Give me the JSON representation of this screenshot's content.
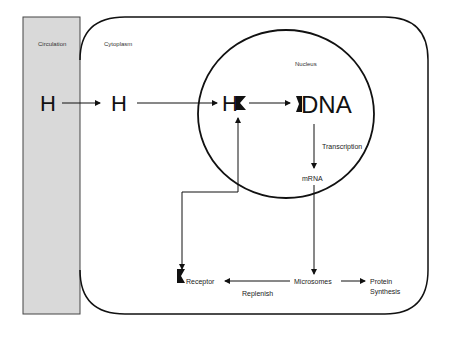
{
  "diagram": {
    "regions": {
      "circulation": "Circulation",
      "cytoplasm": "Cytoplasm",
      "nucleus": "Nucleus"
    },
    "nodes": {
      "h_circulation": "H",
      "h_cytoplasm": "H",
      "h_nucleus": "H",
      "dna": "DNA",
      "mrna": "mRNA",
      "receptor": "Receptor",
      "microsomes": "Microsomes",
      "protein_synthesis_line1": "Protein",
      "protein_synthesis_line2": "Synthesis"
    },
    "edge_labels": {
      "transcription": "Transcription",
      "replenish": "Replenish"
    },
    "colors": {
      "circulation_fill": "#d9d9d9",
      "stroke": "#111111"
    }
  }
}
